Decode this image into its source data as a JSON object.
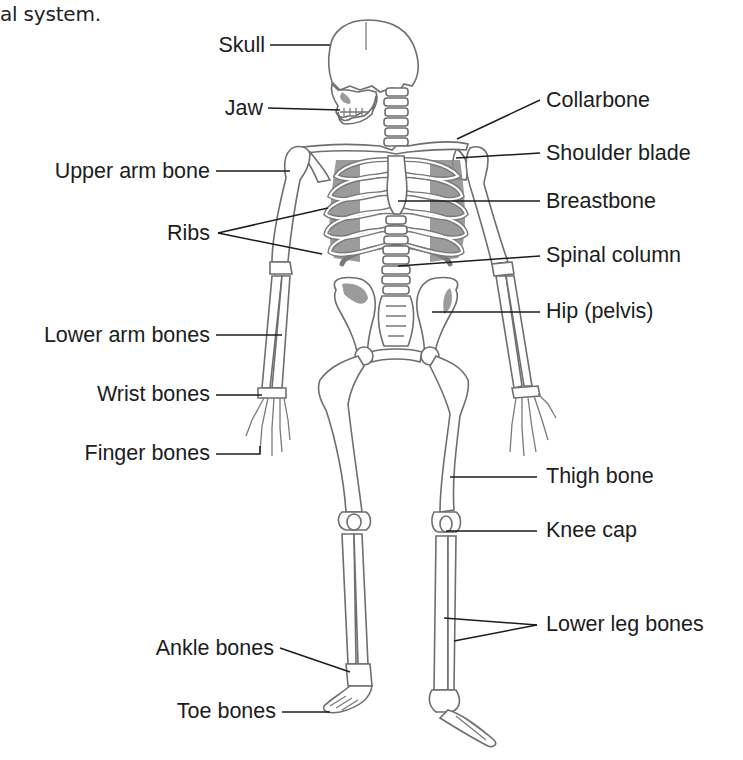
{
  "diagram": {
    "caption": "al system.",
    "labels_left": [
      {
        "id": "skull",
        "text": "Skull"
      },
      {
        "id": "jaw",
        "text": "Jaw"
      },
      {
        "id": "upper-arm-bone",
        "text": "Upper arm bone"
      },
      {
        "id": "ribs",
        "text": "Ribs"
      },
      {
        "id": "lower-arm-bones",
        "text": "Lower arm bones"
      },
      {
        "id": "wrist-bones",
        "text": "Wrist bones"
      },
      {
        "id": "finger-bones",
        "text": "Finger bones"
      },
      {
        "id": "ankle-bones",
        "text": "Ankle bones"
      },
      {
        "id": "toe-bones",
        "text": "Toe bones"
      }
    ],
    "labels_right": [
      {
        "id": "collarbone",
        "text": "Collarbone"
      },
      {
        "id": "shoulder-blade",
        "text": "Shoulder blade"
      },
      {
        "id": "breastbone",
        "text": "Breastbone"
      },
      {
        "id": "spinal-column",
        "text": "Spinal column"
      },
      {
        "id": "hip-pelvis",
        "text": "Hip (pelvis)"
      },
      {
        "id": "thigh-bone",
        "text": "Thigh bone"
      },
      {
        "id": "knee-cap",
        "text": "Knee cap"
      },
      {
        "id": "lower-leg-bones",
        "text": "Lower leg bones"
      }
    ],
    "colors": {
      "background": "#ffffff",
      "text": "#1c1c1c",
      "bone_outline": "#6e6e6e",
      "shading": "#8a8a8a"
    }
  }
}
